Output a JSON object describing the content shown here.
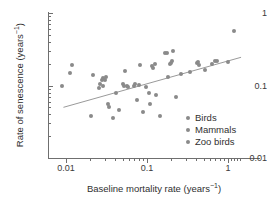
{
  "chart_data": {
    "type": "scatter",
    "title": "",
    "xlabel": "Baseline mortality rate (years−1)",
    "xlabel_base": "Baseline mortality rate (years",
    "xlabel_sup": "−1",
    "xlabel_tail": ")",
    "ylabel": "Rate of senescence (years−1)",
    "ylabel_base": "Rate of senescence (years",
    "ylabel_sup": "−1",
    "ylabel_tail": ")",
    "xscale": "log",
    "yscale": "log",
    "xlim": [
      0.008,
      1.6
    ],
    "ylim": [
      0.01,
      1
    ],
    "grid": false,
    "xticks": [
      "0.01",
      "0.1",
      "1"
    ],
    "xtick_values": [
      0.01,
      0.1,
      1
    ],
    "yticks": [
      "1",
      "0.1",
      "0.01"
    ],
    "ytick_values": [
      1,
      0.1,
      0.01
    ],
    "legend_position": "lower-right",
    "marker_color": "#8a8a8a",
    "line_color": "#9a9a9a",
    "axis_color": "#6f6f6f",
    "text_color": "#2f2f2f",
    "series": [
      {
        "name": "Birds",
        "color": "#8a8a8a",
        "points": [
          [
            0.0089,
            0.1
          ],
          [
            0.0112,
            0.15
          ],
          [
            0.012,
            0.19
          ],
          [
            0.0205,
            0.038
          ],
          [
            0.0215,
            0.14
          ],
          [
            0.0255,
            0.092
          ],
          [
            0.0262,
            0.104
          ],
          [
            0.0275,
            0.12
          ],
          [
            0.0285,
            0.128
          ],
          [
            0.029,
            0.098
          ],
          [
            0.03,
            0.118
          ],
          [
            0.0315,
            0.13
          ],
          [
            0.033,
            0.055
          ],
          [
            0.034,
            0.05
          ],
          [
            0.0385,
            0.036
          ],
          [
            0.042,
            0.08
          ],
          [
            0.045,
            0.046
          ],
          [
            0.05,
            0.105
          ],
          [
            0.0515,
            0.098
          ],
          [
            0.053,
            0.16
          ],
          [
            0.056,
            0.1
          ],
          [
            0.0585,
            0.095
          ]
        ]
      },
      {
        "name": "Mammals",
        "color": "#8a8a8a",
        "points": [
          [
            0.069,
            0.1
          ],
          [
            0.072,
            0.104
          ],
          [
            0.076,
            0.063
          ],
          [
            0.08,
            0.102
          ],
          [
            0.083,
            0.19
          ],
          [
            0.09,
            0.043
          ],
          [
            0.098,
            0.095
          ],
          [
            0.105,
            0.08
          ],
          [
            0.108,
            0.056
          ],
          [
            0.115,
            0.185
          ],
          [
            0.118,
            0.175
          ],
          [
            0.125,
            0.195
          ],
          [
            0.129,
            0.073
          ],
          [
            0.145,
            0.038
          ],
          [
            0.168,
            0.28
          ],
          [
            0.175,
            0.285
          ],
          [
            0.18,
            0.132
          ],
          [
            0.195,
            0.2
          ],
          [
            0.198,
            0.205
          ],
          [
            0.205,
            0.215
          ],
          [
            0.208,
            0.295
          ]
        ]
      },
      {
        "name": "Zoo birds",
        "color": "#8a8a8a",
        "points": [
          [
            0.23,
            0.07
          ],
          [
            0.26,
            0.145
          ],
          [
            0.335,
            0.155
          ],
          [
            0.41,
            0.205
          ],
          [
            0.43,
            0.21
          ],
          [
            0.44,
            0.19
          ],
          [
            0.52,
            0.165
          ],
          [
            0.63,
            0.2
          ],
          [
            0.69,
            0.215
          ],
          [
            0.74,
            0.218
          ],
          [
            0.99,
            0.21
          ],
          [
            1.18,
            0.56
          ]
        ]
      }
    ],
    "trend_line": {
      "name": "regression-line",
      "x_start": 0.0093,
      "y_start": 0.05,
      "x_end": 1.45,
      "y_end": 0.245
    }
  },
  "legend": {
    "items": [
      {
        "label": "Birds"
      },
      {
        "label": "Mammals"
      },
      {
        "label": "Zoo birds"
      }
    ]
  }
}
